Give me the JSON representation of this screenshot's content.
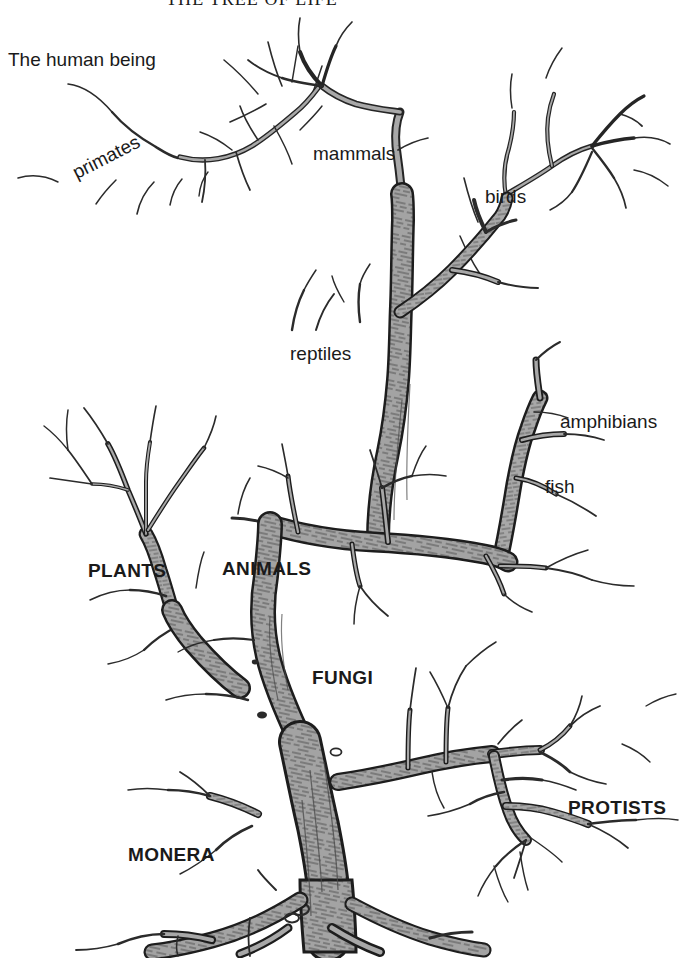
{
  "document": {
    "title": "THE TREE OF LIFE",
    "rule_color": "#1a1a1a"
  },
  "colors": {
    "background": "#ffffff",
    "ink": "#1a1a1a",
    "bark_fill": "#a3a3a3",
    "bark_outline": "#1d1d1d",
    "bark_texture": "#3a3a3a",
    "twig_stroke": "#2a2a2a"
  },
  "diagram": {
    "kind": "tree-of-life-illustration",
    "labels": [
      {
        "id": "human-being",
        "text": "The human being",
        "style": "plain",
        "x": 8,
        "y": 50,
        "rotation": 0,
        "size": 19
      },
      {
        "id": "primates",
        "text": "primates",
        "style": "plain",
        "x": 78,
        "y": 163,
        "rotation": -27,
        "size": 19
      },
      {
        "id": "mammals",
        "text": "mammals",
        "style": "plain",
        "x": 313,
        "y": 144,
        "rotation": 0,
        "size": 19
      },
      {
        "id": "birds",
        "text": "birds",
        "style": "plain",
        "x": 485,
        "y": 187,
        "rotation": 0,
        "size": 19
      },
      {
        "id": "reptiles",
        "text": "reptiles",
        "style": "plain",
        "x": 290,
        "y": 344,
        "rotation": 0,
        "size": 19
      },
      {
        "id": "amphibians",
        "text": "amphibians",
        "style": "plain",
        "x": 560,
        "y": 412,
        "rotation": 0,
        "size": 19
      },
      {
        "id": "fish",
        "text": "fish",
        "style": "plain",
        "x": 545,
        "y": 477,
        "rotation": 0,
        "size": 19
      },
      {
        "id": "plants",
        "text": "PLANTS",
        "style": "bold",
        "x": 88,
        "y": 561,
        "rotation": 0,
        "size": 19
      },
      {
        "id": "animals",
        "text": "ANIMALS",
        "style": "bold",
        "x": 222,
        "y": 559,
        "rotation": 0,
        "size": 19
      },
      {
        "id": "fungi",
        "text": "FUNGI",
        "style": "bold",
        "x": 312,
        "y": 668,
        "rotation": 0,
        "size": 19
      },
      {
        "id": "protists",
        "text": "PROTISTS",
        "style": "bold",
        "x": 568,
        "y": 798,
        "rotation": 0,
        "size": 19
      },
      {
        "id": "monera",
        "text": "MONERA",
        "style": "bold",
        "x": 128,
        "y": 845,
        "rotation": 0,
        "size": 19
      }
    ]
  }
}
